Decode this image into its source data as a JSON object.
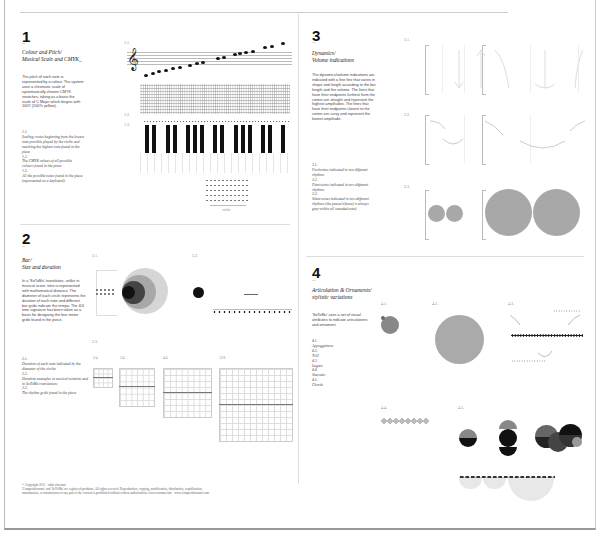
{
  "sections": [
    {
      "number": "1",
      "dash": "–",
      "title_line1": "Colour and Pitch/",
      "title_line2": "Musical Scale and CMYK_",
      "body": "The pitch of each note is represented by a colour. The system uses a chromatic scale of systematically chosen CMYK swatches, taking as a basis the scale of C Major which begins with 100Y (100% yellow).",
      "captions": [
        {
          "label": "1.1.",
          "text": "Scaling: notes beginning from the lowest note possible played by the violin and reaching the highest note found in the piece"
        },
        {
          "label": "1.2.",
          "text": "The CMYK values of all possible colours found in the piece"
        },
        {
          "label": "1.3.",
          "text": "All the possible notes found in the piece (represented on a keyboard)"
        }
      ],
      "figure_labels": [
        "1.1.",
        "1.2.",
        "1.3."
      ],
      "figure_sublabel": "violin"
    },
    {
      "number": "2",
      "dash": "–",
      "title_line1": "Bar/",
      "title_line2": "Size and duration",
      "body": "In a 'SoToMu' translation, unlike in musical score, time is represented with mathematical distance. The diameter of each circle represents the duration of each note and different bar grids indicate the tempo. The 4/4 time signature has been taken as a basis for designing the four meter grids found in the piece.",
      "captions": [
        {
          "label": "2.1.",
          "text": "Duration of each note indicated by the diameter of the circles"
        },
        {
          "label": "2.2.",
          "text": "Duration examples in musical notation and in SoToMu translations"
        },
        {
          "label": "2.3.",
          "text": "The rhythm grids found in the piece"
        }
      ],
      "figure_labels": [
        "2.1.",
        "2.2.",
        "2.3."
      ],
      "time_signatures": [
        "2/4",
        "3/4",
        "4/4",
        "12/8"
      ]
    },
    {
      "number": "3",
      "dash": "–",
      "title_line1": "Dynamics/",
      "title_line2": "Volume indications",
      "body": "The dynamics/volume indications are indicated with a fine line that varies in shape and length according to the bar length and the volume. The lines that have their endpoints furthest from the center are straight and represent the highest amplitudes. The lines that have their endpoints closest to the center are curvy and represent the lowest amplitude.",
      "captions": [
        {
          "label": "3.1.",
          "text": "Fortissimo indicated in two different rhythms"
        },
        {
          "label": "3.2.",
          "text": "Pianissimo indicated in two different rhythms"
        },
        {
          "label": "3.3.",
          "text": "Silent notes indicated in two different rhythms (the pause/silence) is always grey within all sounded note)"
        }
      ],
      "figure_labels": [
        "3.1.",
        "3.2.",
        "3.3."
      ]
    },
    {
      "number": "4",
      "dash": "–",
      "title_line1": "Articulation & Ornaments/",
      "title_line2": "stylistic variations",
      "body": "'SoToMu' uses a set of visual attributes to indicate articulations and ornament",
      "captions": [
        {
          "label": "4.1.",
          "text": "Appoggiatura"
        },
        {
          "label": "4.2.",
          "text": "Trill"
        },
        {
          "label": "4.3.",
          "text": "Legato"
        },
        {
          "label": "4.4.",
          "text": "Staccato"
        },
        {
          "label": "4.5.",
          "text": "Chords"
        }
      ],
      "figure_labels": [
        "4.1.",
        "4.2.",
        "4.3.",
        "4.4.",
        "4.5."
      ]
    }
  ],
  "footer": {
    "line1": "© Copyright 2011 · rabia chaviani",
    "line2": "'Compositionsmo' and 'SoToMu' are registered products. All rights reserved. Reproduction, copying, modification, distribution, republication,",
    "line3": "transmission, or transmission of any part of the content is prohibited without written authorisation.   www.sotomu.com · www.compositionsmo.com"
  },
  "colors": {
    "dark": "#111111",
    "grey_dark": "#444444",
    "grey_mid": "#777777",
    "grey_light": "#a8a8a8",
    "grey_pale": "#d6d6d6"
  }
}
